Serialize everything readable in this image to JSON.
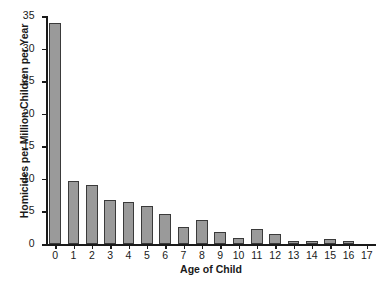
{
  "chart_data": {
    "type": "bar",
    "title": "",
    "xlabel": "Age of Child",
    "ylabel": "Homicides per Million Children per Year",
    "categories": [
      "0",
      "1",
      "2",
      "3",
      "4",
      "5",
      "6",
      "7",
      "8",
      "9",
      "10",
      "11",
      "12",
      "13",
      "14",
      "15",
      "16",
      "17"
    ],
    "values": [
      34.0,
      9.6,
      9.0,
      6.7,
      6.5,
      5.8,
      4.6,
      2.6,
      3.7,
      1.8,
      0.9,
      2.3,
      1.5,
      0.4,
      0.4,
      0.7,
      0.4,
      0.0
    ],
    "ylim": [
      0,
      35
    ],
    "xlim": [
      -0.5,
      17.5
    ],
    "ytick_labels": [
      "0",
      "5",
      "10",
      "15",
      "20",
      "25",
      "30",
      "35"
    ],
    "ytick_values": [
      0,
      5,
      10,
      15,
      20,
      25,
      30,
      35
    ],
    "grid": false,
    "legend": false,
    "bar_color": "#9a9a9a",
    "bar_edge_color": "#3a3a3a",
    "axis_color": "#1a1a1a",
    "background": "#ffffff"
  }
}
